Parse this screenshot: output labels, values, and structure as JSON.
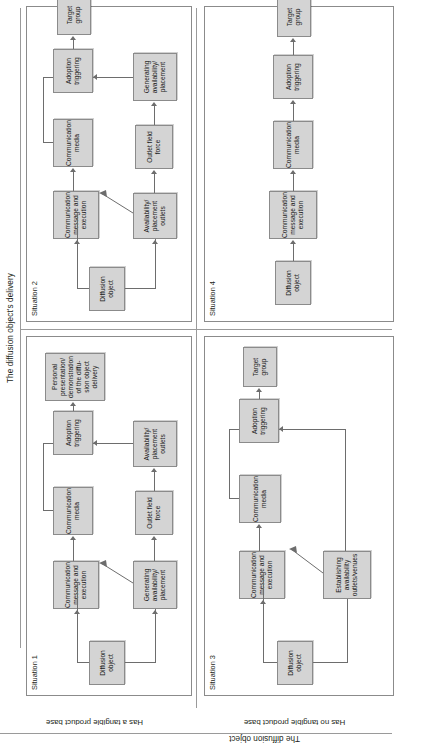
{
  "figure": {
    "column_axis_title": "The diffusion object's delivery",
    "row_axis_title": "The diffusion object",
    "columns": [
      {
        "id": "col1",
        "label": "Requires a personal presentation and demonstration to the adopter"
      },
      {
        "id": "col2",
        "label": "Does not require a personal presentation and demonstration to the adopter"
      }
    ],
    "rows": [
      {
        "id": "row1",
        "label": "Has a tangible product base"
      },
      {
        "id": "row2",
        "label": "Has no tangible product base"
      }
    ]
  },
  "panels": {
    "situation1": {
      "title": "Situation 1",
      "nodes": {
        "diffusion_object": "Diffusion object",
        "comm_message": "Communication message and execution",
        "comm_media": "Communication media",
        "generating_availability": "Generating availability/ placement",
        "outlet_field_force": "Outlet field force",
        "availability_outlets": "Availability/ placement outlets",
        "adoption_triggering": "Adoption triggering",
        "personal_presentation": "Personal presentation/ demonstration of the diffu-sion object delivery",
        "target_group": "Target group"
      }
    },
    "situation2": {
      "title": "Situation 2",
      "nodes": {
        "diffusion_object": "Diffusion object",
        "comm_message": "Communication message and execution",
        "comm_media": "Communication media",
        "availability_outlets": "Availability/ placement outlets",
        "outlet_field_force": "Outlet field force",
        "generating_availability": "Generating availability/ placement",
        "adoption_triggering": "Adoption triggering",
        "target_group": "Target group"
      }
    },
    "situation3": {
      "title": "Situation 3",
      "nodes": {
        "diffusion_object": "Diffusion object",
        "comm_message": "Communication message and execution",
        "comm_media": "Communication media",
        "establishing_availability": "Establishing availability outlets/venues",
        "adoption_triggering": "Adoption triggering",
        "target_group": "Target group"
      }
    },
    "situation4": {
      "title": "Situation 4",
      "nodes": {
        "diffusion_object": "Diffusion object",
        "comm_message": "Communication message and execution",
        "comm_media": "Communication media",
        "adoption_triggering": "Adoption triggering",
        "target_group": "Target group"
      }
    }
  },
  "colors": {
    "node_fill": "#d4d4d4",
    "node_border": "#8b8b8b",
    "connector": "#6d6d6d",
    "rule": "#9a9a9a",
    "text": "#231f20",
    "background": "#ffffff"
  }
}
